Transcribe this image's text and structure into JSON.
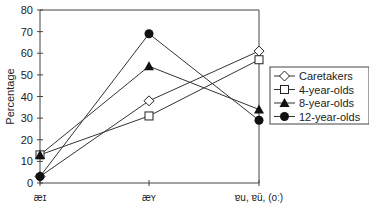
{
  "chart_data": {
    "type": "line",
    "title": "",
    "xlabel": "",
    "ylabel": "Percentage",
    "ylim": [
      0,
      80
    ],
    "yticks": [
      0,
      10,
      20,
      30,
      40,
      50,
      60,
      70,
      80
    ],
    "categories": [
      "æɪ",
      "æʏ",
      "ɐu, ɐü, (oː)"
    ],
    "grid": false,
    "legend_position": "right",
    "series": [
      {
        "name": "Caretakers",
        "marker": "open-diamond",
        "values": [
          3,
          38,
          61
        ]
      },
      {
        "name": "4-year-olds",
        "marker": "open-square",
        "values": [
          13,
          31,
          57
        ]
      },
      {
        "name": "8-year-olds",
        "marker": "filled-triangle",
        "values": [
          13,
          54,
          34
        ]
      },
      {
        "name": "12-year-olds",
        "marker": "filled-circle",
        "values": [
          3,
          69,
          29
        ]
      }
    ]
  }
}
